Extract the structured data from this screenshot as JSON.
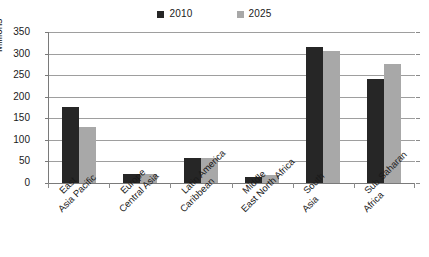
{
  "chart_data": {
    "type": "bar",
    "title": "",
    "subtitle": "",
    "xlabel": "",
    "ylabel": "Millions",
    "ylim": [
      0,
      350
    ],
    "yticks": [
      0,
      50,
      100,
      150,
      200,
      250,
      300,
      350
    ],
    "ytick_labels": [
      "0",
      "50",
      "100",
      "150",
      "200",
      "250",
      "300",
      "350"
    ],
    "grid": true,
    "legend_position": "top-center",
    "categories": [
      "East Asia Pacific",
      "Europe Central Asia",
      "Latin America Caribbean",
      "Middle East North Africa",
      "South Asia",
      "Sub Saharan Africa"
    ],
    "category_label_lines": [
      [
        "East",
        "Asia Pacific"
      ],
      [
        "Europe",
        "Central Asia"
      ],
      [
        "Latin America",
        "Caribbean"
      ],
      [
        "Middle",
        "East North Africa"
      ],
      [
        "South",
        "Asia"
      ],
      [
        "Sub Saharan",
        "Africa"
      ]
    ],
    "series": [
      {
        "name": "2010",
        "color": "#262626",
        "values": [
          176,
          22,
          57,
          15,
          315,
          241
        ]
      },
      {
        "name": "2025",
        "color": "#a8a8a8",
        "values": [
          130,
          21,
          58,
          18,
          306,
          276
        ]
      }
    ]
  },
  "legend": {
    "entries": [
      {
        "label": "2010",
        "color": "#262626"
      },
      {
        "label": "2025",
        "color": "#a8a8a8"
      }
    ]
  },
  "axis": {
    "y_title": "Millions"
  },
  "colors": {
    "background": "#ffffff",
    "gridline": "#9e9e9e",
    "axis_line": "#7a7a7a",
    "series_2010": "#262626",
    "series_2025": "#a8a8a8",
    "text": "#1a1a1a"
  }
}
